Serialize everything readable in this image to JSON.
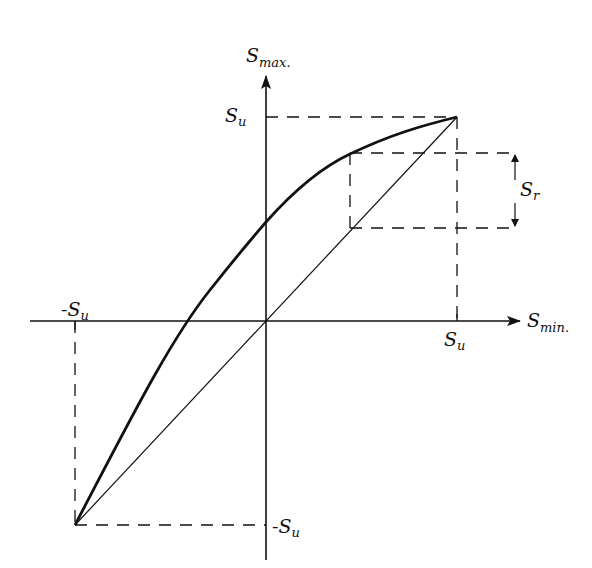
{
  "diagram": {
    "type": "goodman-type fatigue diagram (Smax vs Smin)",
    "axes": {
      "vertical": {
        "label_main": "S",
        "label_sub": "max."
      },
      "horizontal": {
        "label_main": "S",
        "label_sub": "min."
      }
    },
    "tick_labels": {
      "su_vertical": {
        "main": "S",
        "sub": "u"
      },
      "su_horizontal": {
        "main": "S",
        "sub": "u"
      },
      "neg_su_horizontal": {
        "main": "-S",
        "sub": "u"
      },
      "neg_su_vertical": {
        "main": "-S",
        "sub": "u"
      }
    },
    "range_label": {
      "main": "S",
      "sub": "r"
    },
    "colors": {
      "stroke": "#111111",
      "background": "#ffffff"
    }
  }
}
